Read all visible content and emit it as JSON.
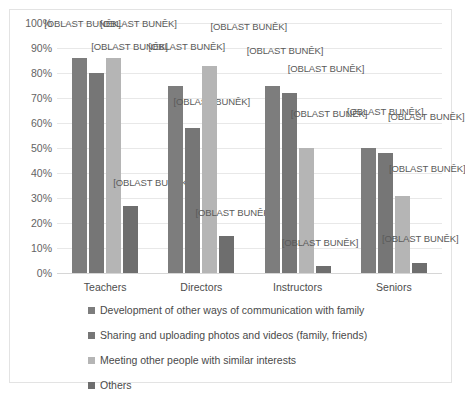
{
  "chart_data": {
    "type": "bar",
    "title": "",
    "subtitle": "",
    "xlabel": "",
    "ylabel": "",
    "ylim": [
      0,
      100
    ],
    "y_tick_labels": [
      "100%",
      "90%",
      "80%",
      "70%",
      "60%",
      "50%",
      "40%",
      "30%",
      "20%",
      "10%",
      "0%"
    ],
    "y_tick_values": [
      100,
      90,
      80,
      70,
      60,
      50,
      40,
      30,
      20,
      10,
      0
    ],
    "grid": true,
    "legend_position": "bottom",
    "categories": [
      "Teachers",
      "Directors",
      "Instructors",
      "Seniors"
    ],
    "series": [
      {
        "name": "Development of other ways of communication with family",
        "color": "#7d7d7d",
        "values": [
          86,
          75,
          75,
          50
        ]
      },
      {
        "name": "Sharing and uploading photos and videos (family, friends)",
        "color": "#767676",
        "values": [
          80,
          58,
          72,
          48
        ]
      },
      {
        "name": "Meeting other people with similar interests",
        "color": "#b5b5b5",
        "values": [
          86,
          83,
          50,
          31
        ]
      },
      {
        "name": "Others",
        "color": "#6e6e6e",
        "values": [
          27,
          15,
          3,
          4
        ]
      }
    ],
    "data_label_text": "[OBLAST BUNĚK]",
    "annotations": [
      {
        "group": "Teachers",
        "series": 0,
        "text": "[OBLAST BUNĚK]"
      },
      {
        "group": "Teachers",
        "series": 1,
        "text": "[OBLAST BUNĚK]"
      },
      {
        "group": "Teachers",
        "series": 2,
        "text": "[OBLAST BUNĚK]"
      },
      {
        "group": "Teachers",
        "series": 3,
        "text": "[OBLAST BUNĚK]"
      },
      {
        "group": "Directors",
        "series": 0,
        "text": "[OBLAST BUNĚK]"
      },
      {
        "group": "Directors",
        "series": 1,
        "text": "[OBLAST BUNĚK]"
      },
      {
        "group": "Directors",
        "series": 2,
        "text": "[OBLAST BUNĚK]"
      },
      {
        "group": "Directors",
        "series": 3,
        "text": "[OBLAST BUNĚK]"
      },
      {
        "group": "Instructors",
        "series": 0,
        "text": "[OBLAST BUNĚK]"
      },
      {
        "group": "Instructors",
        "series": 1,
        "text": "[OBLAST BUNĚK]"
      },
      {
        "group": "Instructors",
        "series": 2,
        "text": "[OBLAST BUNĚK]"
      },
      {
        "group": "Instructors",
        "series": 3,
        "text": "[OBLAST BUNĚK]"
      },
      {
        "group": "Seniors",
        "series": 0,
        "text": "[OBLAST BUNĚK]"
      },
      {
        "group": "Seniors",
        "series": 1,
        "text": "[OBLAST BUNĚK]"
      },
      {
        "group": "Seniors",
        "series": 2,
        "text": "[OBLAST BUNĚK]"
      },
      {
        "group": "Seniors",
        "series": 3,
        "text": "[OBLAST BUNĚK]"
      }
    ]
  },
  "axis": {
    "y_labels": [
      "100%",
      "90%",
      "80%",
      "70%",
      "60%",
      "50%",
      "40%",
      "30%",
      "20%",
      "10%",
      "0%"
    ],
    "x_labels": [
      "Teachers",
      "Directors",
      "Instructors",
      "Seniors"
    ]
  },
  "legend": {
    "items": [
      {
        "label": "Development of other ways of communication with family",
        "color": "#7d7d7d"
      },
      {
        "label": "Sharing and uploading photos and videos (family, friends)",
        "color": "#767676"
      },
      {
        "label": "Meeting other people with similar interests",
        "color": "#b5b5b5"
      },
      {
        "label": "Others",
        "color": "#6e6e6e"
      }
    ]
  }
}
